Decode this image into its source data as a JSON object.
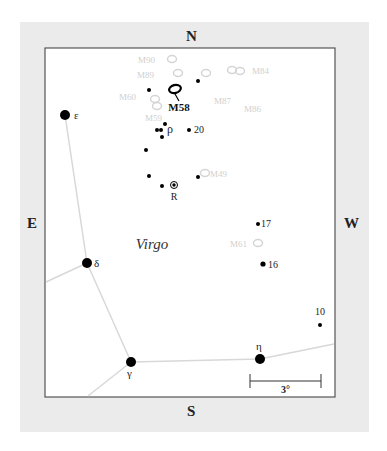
{
  "chart_data": {
    "type": "scatter",
    "directions": {
      "north": "N",
      "south": "S",
      "east": "E",
      "west": "W"
    },
    "constellation": "Virgo",
    "target": {
      "label": "M58",
      "x": 175,
      "y": 89
    },
    "scale_bar": {
      "label": "3°",
      "x1": 250,
      "x2": 321,
      "y": 381
    },
    "bright_stars": [
      {
        "label": "ε",
        "x": 65,
        "y": 115,
        "r": 5
      },
      {
        "label": "δ",
        "x": 87,
        "y": 263,
        "r": 5
      },
      {
        "label": "γ",
        "x": 131,
        "y": 362,
        "r": 5
      },
      {
        "label": "η",
        "x": 260,
        "y": 359,
        "r": 5
      }
    ],
    "faint_stars": [
      {
        "label": "ρ",
        "x": 161,
        "y": 130
      },
      {
        "label": "20",
        "x": 189,
        "y": 130
      },
      {
        "label": "17",
        "x": 258,
        "y": 224
      },
      {
        "label": "16",
        "x": 263,
        "y": 264
      },
      {
        "label": "10",
        "x": 320,
        "y": 325
      },
      {
        "label": "",
        "x": 149,
        "y": 90
      },
      {
        "label": "",
        "x": 198,
        "y": 81
      },
      {
        "label": "",
        "x": 165,
        "y": 124
      },
      {
        "label": "",
        "x": 157,
        "y": 130
      },
      {
        "label": "",
        "x": 162,
        "y": 137
      },
      {
        "label": "",
        "x": 146,
        "y": 150
      },
      {
        "label": "",
        "x": 149,
        "y": 176
      },
      {
        "label": "",
        "x": 162,
        "y": 186
      },
      {
        "label": "",
        "x": 198,
        "y": 177
      }
    ],
    "variable_star": {
      "label": "R",
      "x": 174,
      "y": 185
    },
    "galaxies": [
      {
        "label": "M90",
        "x": 172,
        "y": 59
      },
      {
        "label": "M89",
        "x": 178,
        "y": 73
      },
      {
        "label": "M87",
        "x": 206,
        "y": 73
      },
      {
        "label": "M84",
        "x": 232,
        "y": 70
      },
      {
        "label": "M86",
        "x": 240,
        "y": 71
      },
      {
        "label": "M60",
        "x": 155,
        "y": 99
      },
      {
        "label": "M59",
        "x": 157,
        "y": 106
      },
      {
        "label": "M49",
        "x": 205,
        "y": 173
      },
      {
        "label": "M61",
        "x": 258,
        "y": 243
      }
    ]
  }
}
